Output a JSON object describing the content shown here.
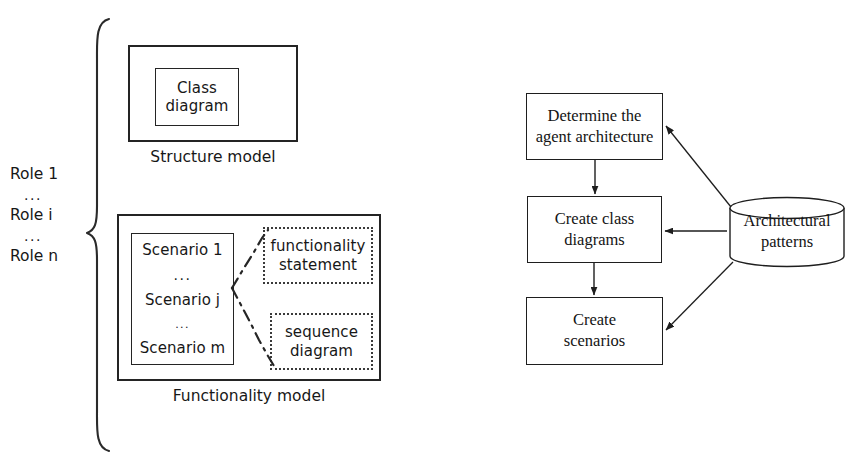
{
  "figure": {
    "type": "diagram"
  },
  "left_panel": {
    "brace_labels": [
      {
        "text": "Role 1",
        "kind": "label"
      },
      {
        "text": "...",
        "kind": "ellipsis"
      },
      {
        "text": "Role i",
        "kind": "label"
      },
      {
        "text": "...",
        "kind": "ellipsis"
      },
      {
        "text": "Role n",
        "kind": "label"
      }
    ],
    "structure_model": {
      "caption": "Structure model",
      "inner_box": {
        "line1": "Class",
        "line2": "diagram"
      }
    },
    "functionality_model": {
      "caption": "Functionality model",
      "scenario_box": {
        "items": [
          {
            "text": "Scenario 1",
            "kind": "label"
          },
          {
            "text": "...",
            "kind": "ellipsis-large"
          },
          {
            "text": "Scenario j",
            "kind": "label"
          },
          {
            "text": "...",
            "kind": "ellipsis-small"
          },
          {
            "text": "Scenario m",
            "kind": "label"
          }
        ]
      },
      "artifacts": [
        {
          "line1": "functionality",
          "line2": "statement"
        },
        {
          "line1": "sequence",
          "line2": "diagram"
        }
      ]
    }
  },
  "right_panel": {
    "steps": [
      {
        "line1": "Determine the",
        "line2": "agent architecture"
      },
      {
        "line1": "Create class",
        "line2": "diagrams"
      },
      {
        "line1": "Create",
        "line2": "scenarios"
      }
    ],
    "datastore": {
      "line1": "Architectural",
      "line2": "patterns"
    }
  },
  "style": {
    "stroke": "#1e1e1e",
    "background": "#ffffff"
  }
}
